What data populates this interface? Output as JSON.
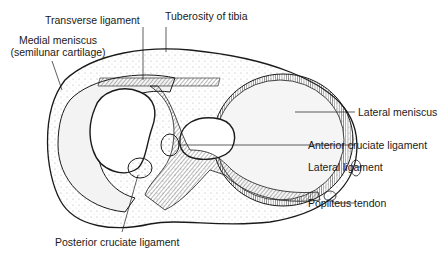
{
  "diagram": {
    "labels": {
      "transverse_ligament": "Transverse ligament",
      "tuberosity_of_tibia": "Tuberosity of tibia",
      "medial_meniscus_line1": "Medial meniscus",
      "medial_meniscus_line2": "(semilunar cartilage)",
      "lateral_meniscus": "Lateral meniscus",
      "anterior_cruciate_ligament": "Anterior cruciate ligament",
      "lateral_ligament": "Lateral ligament",
      "popliteus_tendon": "Popliteus tendon",
      "posterior_cruciate_ligament": "Posterior cruciate ligament"
    },
    "colors": {
      "ink": "#1a1a1a",
      "background": "#ffffff",
      "stipple": "#d9d9d9"
    }
  }
}
